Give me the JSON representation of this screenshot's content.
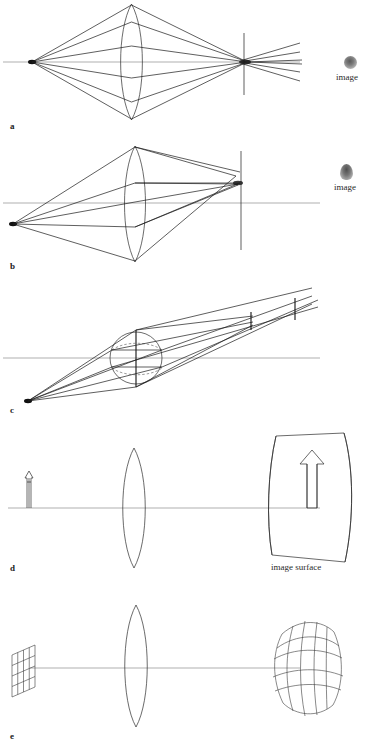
{
  "figure": {
    "background_color": "#ffffff",
    "ink_color": "#1a1a1a",
    "axis_color": "#8e8e8e",
    "width": 389,
    "height": 744
  },
  "panels": [
    {
      "id": "a",
      "label": "a",
      "label_x": 10,
      "label_y": 128,
      "aberration": "spherical-aberration",
      "annotation": "image",
      "annotation_x": 338,
      "annotation_y": 82,
      "blur_spot": "round-compact",
      "description": "On-axis point source, symmetric ray fan through biconvex lens converging to a blurred focus with a vertical focal-plane line; rays cross and diverge beyond."
    },
    {
      "id": "b",
      "label": "b",
      "label_x": 10,
      "label_y": 268,
      "aberration": "coma",
      "annotation": "image",
      "annotation_x": 338,
      "annotation_y": 190,
      "blur_spot": "comet-teardrop",
      "description": "Off-axis point source below the axis; asymmetric ray bundle forms a comet-shaped flare on a vertical image plane."
    },
    {
      "id": "c",
      "label": "c",
      "label_x": 10,
      "label_y": 412,
      "aberration": "astigmatism",
      "description": "Strongly oblique pencil through a circular aperture; tangential and sagittal rays focus at two separated short line foci."
    },
    {
      "id": "d",
      "label": "d",
      "label_x": 10,
      "label_y": 570,
      "aberration": "field-curvature",
      "annotation": "image surface",
      "annotation_x": 272,
      "annotation_y": 567,
      "description": "Flat arrow object imaged by a lens onto a curved image surface rather than a flat plane."
    },
    {
      "id": "e",
      "label": "e",
      "label_x": 10,
      "label_y": 738,
      "aberration": "distortion",
      "description": "Flat square grid object imaged through a lens into a barrel-distorted curved grid."
    }
  ],
  "labels": {
    "image": "image",
    "image_surface": "image surface",
    "a": "a",
    "b": "b",
    "c": "c",
    "d": "d",
    "e": "e"
  }
}
